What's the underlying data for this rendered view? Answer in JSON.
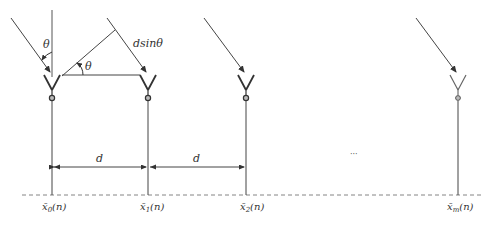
{
  "labels": {
    "theta_top": "θ",
    "theta_mid": "θ",
    "path_diff": "dsinθ",
    "spacing_1": "d",
    "spacing_2": "d",
    "ellipsis": "···"
  },
  "elements": [
    {
      "id": "x0",
      "label_base": "x̄",
      "subscript": "0",
      "arg": "(n)",
      "x": 52
    },
    {
      "id": "x1",
      "label_base": "x̄",
      "subscript": "1",
      "arg": "(n)",
      "x": 148
    },
    {
      "id": "x2",
      "label_base": "x̄",
      "subscript": "2",
      "arg": "(n)",
      "x": 246
    },
    {
      "id": "xm",
      "label_base": "x̄",
      "subscript": "m",
      "arg": "(n)",
      "x": 458
    }
  ],
  "colors": {
    "line": "#444444",
    "dashed": "#777777",
    "text": "#333333"
  }
}
